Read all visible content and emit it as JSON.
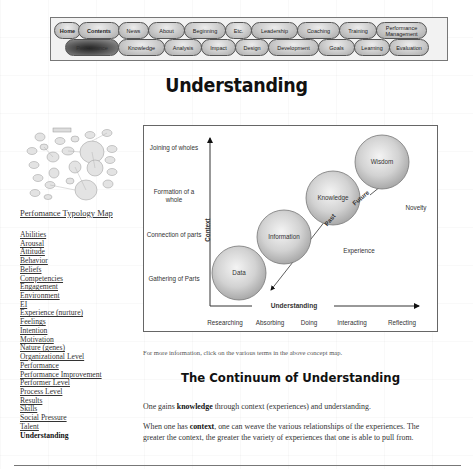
{
  "nav": {
    "row1": [
      {
        "label": "Home",
        "bold": true
      },
      {
        "label": "Contents",
        "bold": true
      },
      {
        "label": "News"
      },
      {
        "label": "About"
      },
      {
        "label": "Beginning"
      },
      {
        "label": "Etc."
      },
      {
        "label": "Leadership"
      },
      {
        "label": "Coaching"
      },
      {
        "label": "Training"
      },
      {
        "label": "Performance Management"
      }
    ],
    "row2": [
      {
        "label": "Performance",
        "active": true
      },
      {
        "label": "Knowledge"
      },
      {
        "label": "Analysis"
      },
      {
        "label": "Impact"
      },
      {
        "label": "Design"
      },
      {
        "label": "Development"
      },
      {
        "label": "Goals"
      },
      {
        "label": "Learning"
      },
      {
        "label": "Evaluation"
      }
    ]
  },
  "page": {
    "title": "Understanding"
  },
  "sidebar": {
    "map_link": "Perfomance Typology Map",
    "items": [
      "Abilities",
      "Arousal",
      "Attitude",
      "Behavior",
      "Beliefs",
      "Competencies",
      "Engagement",
      "Environment",
      "EI",
      "Experience (nurture)",
      "Feelings",
      "Intention",
      "Motivation",
      "Nature (genes)",
      "Organizational Level",
      "Performance",
      "Performance Improvement",
      "Performer Level",
      "Process Level",
      "Results",
      "Skills",
      "Social Pressure",
      "Talent"
    ],
    "current": "Understanding"
  },
  "diagram": {
    "y_axis_label": "Context",
    "x_axis_label": "Understanding",
    "y_levels": [
      "Joining of wholes",
      "Formation of a whole",
      "Connection of parts",
      "Gathering of Parts"
    ],
    "x_levels": [
      "Researching",
      "Absorbing",
      "Doing",
      "Interacting",
      "Reflecting"
    ],
    "spheres": [
      "Data",
      "Information",
      "Knowledge",
      "Wisdom"
    ],
    "past_label": "Past",
    "future_label": "Future",
    "experience_label": "Experience",
    "novelty_label": "Novelty"
  },
  "content": {
    "caption": "For more information, click on the various terms in the above concept map.",
    "section_title": "The Continuum of Understanding",
    "p1_pre": "One gains ",
    "p1_bold": "knowledge",
    "p1_post": " through context (experiences) and understanding.",
    "p2_pre": "When one has ",
    "p2_bold": "context",
    "p2_post": ", one can weave the various relationships of the experiences. The greater the context, the greater the variety of experiences that one is able to pull from."
  }
}
